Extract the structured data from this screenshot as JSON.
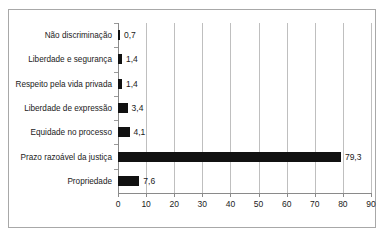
{
  "clipped_top_text": "",
  "chart_data": {
    "type": "bar",
    "orientation": "horizontal",
    "title": "",
    "subtitle": "",
    "xlabel": "",
    "ylabel": "",
    "xlim": [
      0,
      90
    ],
    "xticks": [
      "0",
      "10",
      "20",
      "30",
      "40",
      "50",
      "60",
      "70",
      "80",
      "90"
    ],
    "grid": "vertical",
    "legend": "none",
    "bar_color": "#111111",
    "categories": [
      "Não discriminação",
      "Liberdade e segurança",
      "Respeito pela vida privada",
      "Liberdade de expressão",
      "Equidade no processo",
      "Prazo razoável da justiça",
      "Propriedade"
    ],
    "values": [
      0.7,
      1.4,
      1.4,
      3.4,
      4.1,
      79.3,
      7.6
    ],
    "value_labels": [
      "0,7",
      "1,4",
      "1,4",
      "3,4",
      "4,1",
      "79,3",
      "7,6"
    ]
  }
}
